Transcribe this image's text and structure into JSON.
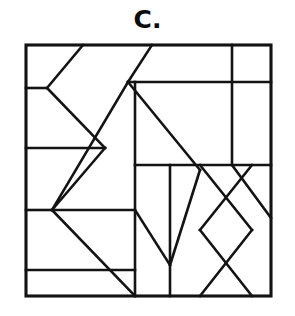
{
  "figure": {
    "label": "C.",
    "kind": "line-partition-puzzle",
    "canvas": {
      "width": 295,
      "height": 316
    },
    "colors": {
      "background": "#ffffff",
      "ink": "#131313",
      "label": "#0d0d0d"
    },
    "frame": {
      "x": 26,
      "y": 45,
      "width": 245,
      "height": 251,
      "stroke_width": 3.1
    },
    "segments": [
      {
        "name": "top-left-kite-upper",
        "x1": 26,
        "y1": 88,
        "x2": 47,
        "y2": 88
      },
      {
        "name": "kite-vertex-to-top-edge",
        "x1": 47,
        "y1": 88,
        "x2": 83,
        "y2": 45
      },
      {
        "name": "kite-vertex-to-mid-cross",
        "x1": 47,
        "y1": 88,
        "x2": 105,
        "y2": 148
      },
      {
        "name": "mid-cross-down-left",
        "x1": 105,
        "y1": 148,
        "x2": 52,
        "y2": 210
      },
      {
        "name": "left-horizontal-upper",
        "x1": 26,
        "y1": 148,
        "x2": 105,
        "y2": 148
      },
      {
        "name": "left-horizontal-mid",
        "x1": 26,
        "y1": 210,
        "x2": 52,
        "y2": 210
      },
      {
        "name": "left-horizontal-lower",
        "x1": 26,
        "y1": 270,
        "x2": 135,
        "y2": 270
      },
      {
        "name": "mid-left-horizontal-band",
        "x1": 52,
        "y1": 210,
        "x2": 135,
        "y2": 210
      },
      {
        "name": "apex-to-top-edge",
        "x1": 128,
        "y1": 82,
        "x2": 152,
        "y2": 45
      },
      {
        "name": "apex-to-lower-left",
        "x1": 128,
        "y1": 82,
        "x2": 52,
        "y2": 210
      },
      {
        "name": "apex-vertical-down",
        "x1": 135,
        "y1": 82,
        "x2": 135,
        "y2": 296
      },
      {
        "name": "apex-diagonal-to-right",
        "x1": 128,
        "y1": 82,
        "x2": 200,
        "y2": 170
      },
      {
        "name": "upper-horizontal-right",
        "x1": 128,
        "y1": 82,
        "x2": 271,
        "y2": 82
      },
      {
        "name": "upper-right-vertical",
        "x1": 232,
        "y1": 45,
        "x2": 232,
        "y2": 165
      },
      {
        "name": "mid-horizontal-right",
        "x1": 135,
        "y1": 165,
        "x2": 271,
        "y2": 165
      },
      {
        "name": "center-vertical",
        "x1": 170,
        "y1": 165,
        "x2": 170,
        "y2": 296
      },
      {
        "name": "v-left-arm",
        "x1": 135,
        "y1": 210,
        "x2": 170,
        "y2": 265
      },
      {
        "name": "v-right-arm",
        "x1": 170,
        "y1": 265,
        "x2": 200,
        "y2": 170
      },
      {
        "name": "x-upper-left-arm",
        "x1": 200,
        "y1": 165,
        "x2": 252,
        "y2": 230
      },
      {
        "name": "x-upper-right-arm",
        "x1": 252,
        "y1": 165,
        "x2": 200,
        "y2": 230
      },
      {
        "name": "x-lower-left-arm",
        "x1": 200,
        "y1": 230,
        "x2": 252,
        "y2": 296
      },
      {
        "name": "x-lower-right-arm",
        "x1": 252,
        "y1": 230,
        "x2": 200,
        "y2": 296
      },
      {
        "name": "lower-left-diagonal",
        "x1": 52,
        "y1": 210,
        "x2": 135,
        "y2": 296
      },
      {
        "name": "right-edge-diagonal",
        "x1": 232,
        "y1": 165,
        "x2": 271,
        "y2": 218
      }
    ]
  }
}
